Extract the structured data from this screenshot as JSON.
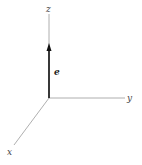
{
  "diagram": {
    "type": "3d-coordinate-axes",
    "axes": [
      {
        "name": "z",
        "label": "z"
      },
      {
        "name": "y",
        "label": "y"
      },
      {
        "name": "x",
        "label": "x"
      }
    ],
    "vector": {
      "label": "e",
      "direction": "z"
    },
    "colors": {
      "axis": "#9a9a9a",
      "vector": "#111111",
      "label": "#444444"
    }
  }
}
